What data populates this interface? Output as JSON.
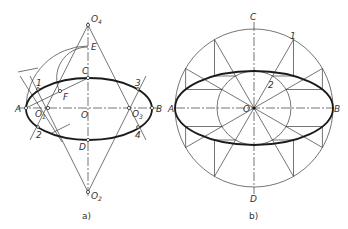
{
  "figure_a": {
    "caption": "a)",
    "labels": {
      "O4": "O",
      "O4_sub": "4",
      "E": "E",
      "C": "C",
      "F": "F",
      "A": "A",
      "O1": "O",
      "O1_sub": "1",
      "O": "O",
      "O3": "O",
      "O3_sub": "3",
      "B": "B",
      "D": "D",
      "O2": "O",
      "O2_sub": "2",
      "p1": "1",
      "p2": "2",
      "p3": "3",
      "p4": "4"
    }
  },
  "figure_b": {
    "caption": "b)",
    "labels": {
      "C": "C",
      "A": "A",
      "O": "O",
      "B": "B",
      "D": "D",
      "p1": "1",
      "p2": "2"
    }
  }
}
